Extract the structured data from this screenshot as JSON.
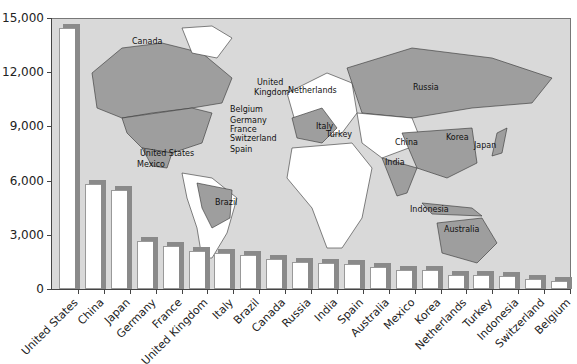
{
  "chart_data": {
    "type": "bar",
    "title": "",
    "xlabel": "",
    "ylabel": "",
    "ylim": [
      0,
      15000
    ],
    "yticks": [
      "0",
      "3,000",
      "6,000",
      "9,000",
      "12,000",
      "15,000"
    ],
    "grid": false,
    "legend": null,
    "background": "world map highlighting the listed countries",
    "categories": [
      "United States",
      "China",
      "Japan",
      "Germany",
      "France",
      "United Kingdom",
      "Italy",
      "Brazil",
      "Canada",
      "Russia",
      "India",
      "Spain",
      "Australia",
      "Mexico",
      "Korea",
      "Netherlands",
      "Turkey",
      "Indonesia",
      "Switzerland",
      "Belgium"
    ],
    "values": [
      14450,
      5800,
      5480,
      2650,
      2370,
      2100,
      1990,
      1880,
      1660,
      1490,
      1440,
      1380,
      1220,
      1050,
      1050,
      770,
      770,
      720,
      550,
      440
    ]
  },
  "map_labels": [
    {
      "text": "Canada",
      "x": 132,
      "y": 37
    },
    {
      "text": "United States",
      "x": 140,
      "y": 149
    },
    {
      "text": "Mexico",
      "x": 137,
      "y": 160
    },
    {
      "text": "Brazil",
      "x": 215,
      "y": 198
    },
    {
      "text": "United",
      "x": 257,
      "y": 78
    },
    {
      "text": "Kingdom",
      "x": 254,
      "y": 88
    },
    {
      "text": "Netherlands",
      "x": 288,
      "y": 86
    },
    {
      "text": "Belgium",
      "x": 230,
      "y": 105
    },
    {
      "text": "Germany",
      "x": 230,
      "y": 116
    },
    {
      "text": "France",
      "x": 230,
      "y": 125
    },
    {
      "text": "Switzerland",
      "x": 230,
      "y": 134
    },
    {
      "text": "Spain",
      "x": 230,
      "y": 145
    },
    {
      "text": "Italy",
      "x": 316,
      "y": 122
    },
    {
      "text": "Turkey",
      "x": 326,
      "y": 130
    },
    {
      "text": "Russia",
      "x": 413,
      "y": 83
    },
    {
      "text": "China",
      "x": 395,
      "y": 138
    },
    {
      "text": "Korea",
      "x": 446,
      "y": 133
    },
    {
      "text": "Japan",
      "x": 474,
      "y": 141
    },
    {
      "text": "India",
      "x": 385,
      "y": 158
    },
    {
      "text": "Indonesia",
      "x": 410,
      "y": 205
    },
    {
      "text": "Australia",
      "x": 444,
      "y": 225
    }
  ],
  "colors": {
    "plot_bg": "#d9d9d9",
    "highlight_country": "#9e9e9e",
    "other_land": "#ffffff",
    "bar_face": "#ffffff",
    "bar_shadow": "#8a8a8a"
  }
}
